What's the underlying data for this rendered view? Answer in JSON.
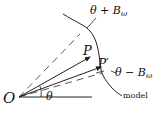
{
  "diagram": {
    "origin_label": "O",
    "point_p_label": "P",
    "point_p_prime_label": "P′",
    "upper_bound_label_prefix": "θ + B",
    "upper_bound_label_sub": "ω",
    "lower_bound_label_prefix": "θ − B",
    "lower_bound_label_sub": "ω",
    "curve_label": "model",
    "angle_label": "θ"
  },
  "colors": {
    "stroke": "#222222",
    "background": "#ffffff"
  }
}
